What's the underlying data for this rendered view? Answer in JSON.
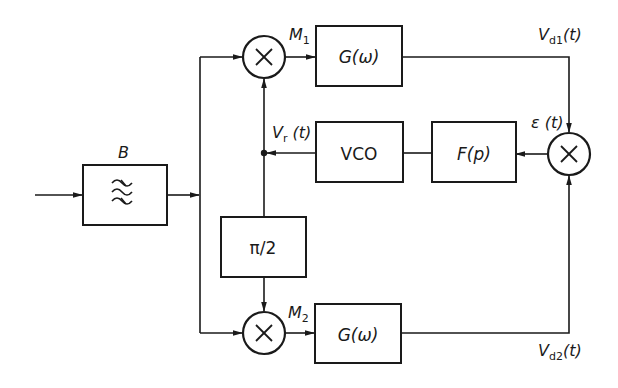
{
  "diagram": {
    "type": "block-diagram",
    "blocks": {
      "bandpass": {
        "label": "B",
        "icon": "bandpass-filter-waves-icon"
      },
      "lowpass_top": {
        "label": "G(ω)"
      },
      "lowpass_bottom": {
        "label": "G(ω)"
      },
      "vco": {
        "label": "VCO"
      },
      "loop_filter": {
        "label": "F(p)"
      },
      "phase_shift": {
        "label": "π/2"
      }
    },
    "multipliers": {
      "m1": {
        "label": "M",
        "sub": "1",
        "symbol": "×"
      },
      "m2": {
        "label": "M",
        "sub": "2",
        "symbol": "×"
      },
      "error": {
        "symbol": "×"
      }
    },
    "signals": {
      "vd1": {
        "label": "V",
        "sub": "d1",
        "suffix": "(t)"
      },
      "vd2": {
        "label": "V",
        "sub": "d2",
        "suffix": "(t)"
      },
      "vr": {
        "label": "V",
        "sub": "r",
        "suffix": " (t)"
      },
      "eps": {
        "label": "ε (t)"
      }
    },
    "connections": [
      {
        "from": "input",
        "to": "bandpass"
      },
      {
        "from": "bandpass",
        "to": "m1"
      },
      {
        "from": "bandpass",
        "to": "m2"
      },
      {
        "from": "m1",
        "to": "lowpass_top"
      },
      {
        "from": "m2",
        "to": "lowpass_bottom"
      },
      {
        "from": "lowpass_top",
        "to": "error",
        "signal": "vd1"
      },
      {
        "from": "lowpass_bottom",
        "to": "error",
        "signal": "vd2"
      },
      {
        "from": "error",
        "to": "loop_filter",
        "signal": "eps"
      },
      {
        "from": "loop_filter",
        "to": "vco"
      },
      {
        "from": "vco",
        "to": "m1",
        "signal": "vr"
      },
      {
        "from": "vco",
        "to": "phase_shift",
        "signal": "vr"
      },
      {
        "from": "phase_shift",
        "to": "m2"
      }
    ],
    "colors": {
      "ink": "#1a1a1a",
      "background": "#ffffff"
    }
  }
}
